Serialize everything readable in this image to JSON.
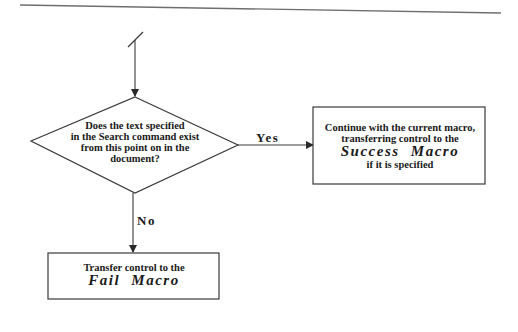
{
  "diagram": {
    "type": "flowchart",
    "nodes": {
      "decision": {
        "shape": "diamond",
        "lines": [
          "Does the text specified",
          "in the Search command exist",
          "from this point on in the",
          "document?"
        ]
      },
      "success": {
        "shape": "rectangle",
        "lines": [
          "Continue with the current macro,",
          "transferring control to the"
        ],
        "macro": "Success Macro",
        "tail": "if it is specified"
      },
      "fail": {
        "shape": "rectangle",
        "lines": [
          "Transfer control to the"
        ],
        "macro": "Fail Macro"
      }
    },
    "edges": [
      {
        "from": "entry",
        "to": "decision",
        "label": ""
      },
      {
        "from": "decision",
        "to": "success",
        "label": "Yes"
      },
      {
        "from": "decision",
        "to": "fail",
        "label": "No"
      }
    ],
    "edge_labels": {
      "yes": "Yes",
      "no": "No"
    },
    "colors": {
      "stroke": "#3a3a3a",
      "text": "#1a1a1a",
      "background": "#ffffff",
      "rule": "#6e6e6e"
    }
  }
}
